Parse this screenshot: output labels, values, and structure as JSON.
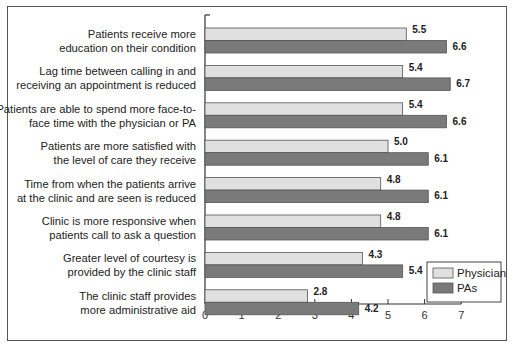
{
  "chart_data": {
    "type": "bar",
    "orientation": "horizontal",
    "title": "",
    "xlabel": "",
    "ylabel": "",
    "xlim": [
      0,
      7
    ],
    "xticks": [
      "0",
      "1",
      "2",
      "3",
      "4",
      "5",
      "6",
      "7"
    ],
    "grid": false,
    "legend_position": "bottom-right",
    "categories": [
      [
        "Patients receive more",
        "education on their condition"
      ],
      [
        "Lag time between calling in and",
        "receiving an appointment is reduced"
      ],
      [
        "Patients are able to spend more face-to-",
        "face time with the physician or PA"
      ],
      [
        "Patients are more satisfied with",
        "the level of care they receive"
      ],
      [
        "Time from when the patients arrive",
        "at the clinic and are seen is reduced"
      ],
      [
        "Clinic is more responsive when",
        "patients call to ask a question"
      ],
      [
        "Greater level of courtesy is",
        "provided by the clinic staff"
      ],
      [
        "The clinic staff provides",
        "more administrative aid"
      ]
    ],
    "series": [
      {
        "name": "Physician",
        "color": "#e0e0e0",
        "values": [
          5.5,
          5.4,
          5.4,
          5.0,
          4.8,
          4.8,
          4.3,
          2.8
        ],
        "labels": [
          "5.5",
          "5.4",
          "5.4",
          "5.0",
          "4.8",
          "4.8",
          "4.3",
          "2.8"
        ]
      },
      {
        "name": "PAs",
        "color": "#7a7a7a",
        "values": [
          6.6,
          6.7,
          6.6,
          6.1,
          6.1,
          6.1,
          5.4,
          4.2
        ],
        "labels": [
          "6.6",
          "6.7",
          "6.6",
          "6.1",
          "6.1",
          "6.1",
          "5.4",
          "4.2"
        ]
      }
    ]
  }
}
